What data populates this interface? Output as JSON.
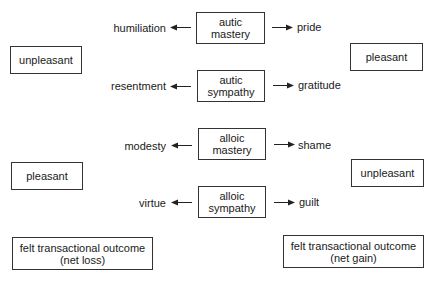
{
  "center_boxes": [
    {
      "line1": "autic",
      "line2": "mastery"
    },
    {
      "line1": "autic",
      "line2": "sympathy"
    },
    {
      "line1": "alloic",
      "line2": "mastery"
    },
    {
      "line1": "alloic",
      "line2": "sympathy"
    }
  ],
  "left_emotions": [
    "humiliation",
    "resentment",
    "modesty",
    "virtue"
  ],
  "right_emotions": [
    "pride",
    "gratitude",
    "shame",
    "guilt"
  ],
  "valence": {
    "left_top": "unpleasant",
    "right_top": "pleasant",
    "left_bottom": "pleasant",
    "right_bottom": "unpleasant"
  },
  "outcomes": {
    "left": {
      "line1": "felt transactional outcome",
      "line2": "(net loss)"
    },
    "right": {
      "line1": "felt transactional outcome",
      "line2": "(net gain)"
    }
  }
}
